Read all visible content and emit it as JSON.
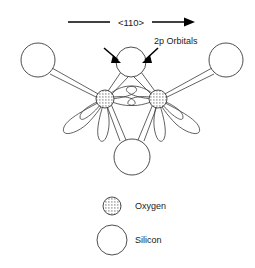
{
  "figure": {
    "title_text": "",
    "background_color": "#ffffff",
    "line_color": "#3a3a3a",
    "arrow_color": "#000000",
    "text_color": "#1a1a1a",
    "direction_indicator": {
      "label": "<110>",
      "name": "crystallographic-direction-110",
      "arrow_direction": "right"
    },
    "annotation": {
      "label": "2p Orbitals",
      "pointer_count": 2
    },
    "legend": {
      "items": [
        {
          "label": "Oxygen",
          "symbol": "stippled-circle",
          "radius_px": 9,
          "fill": "stipple"
        },
        {
          "label": "Silicon",
          "symbol": "open-circle",
          "radius_px": 15,
          "fill": "none"
        }
      ]
    },
    "atoms": {
      "oxygen": [
        {
          "id": "O-left",
          "cx": 105,
          "cy": 99,
          "r": 9
        },
        {
          "id": "O-right",
          "cx": 158,
          "cy": 99,
          "r": 9
        }
      ],
      "silicon": [
        {
          "id": "Si-top-left-outer",
          "cx": 38,
          "cy": 60,
          "r": 17
        },
        {
          "id": "Si-top-center",
          "cx": 131,
          "cy": 62,
          "r": 15
        },
        {
          "id": "Si-top-right-outer",
          "cx": 226,
          "cy": 60,
          "r": 17
        },
        {
          "id": "Si-bottom-center",
          "cx": 132,
          "cy": 157,
          "r": 18
        }
      ]
    },
    "orbital_lobes": {
      "count_per_oxygen": 5,
      "shape": "teardrop"
    }
  }
}
